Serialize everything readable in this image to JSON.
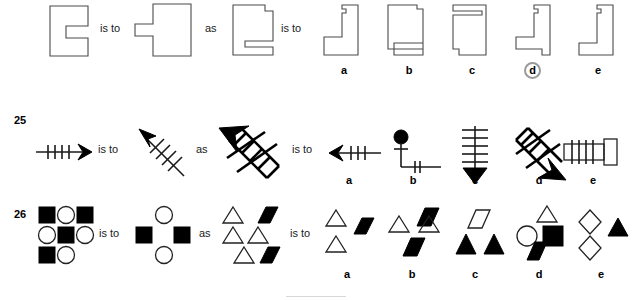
{
  "page": {
    "width": 635,
    "height": 300,
    "background": "#ffffff",
    "ink_color": "#1a1a1a",
    "outline_color": "#4a4a4a",
    "fill_color": "#000000"
  },
  "connectors": {
    "is_to": "is to",
    "as": "as"
  },
  "option_labels": [
    "a",
    "b",
    "c",
    "d",
    "e"
  ],
  "rows": [
    {
      "number": "",
      "name": "row-shapes-polygon",
      "type": "visual-analogy",
      "prompt_a": "notched-rectangle",
      "prompt_b": "rotated-notched-rectangle",
      "prompt_c": "tall-shape-with-step",
      "selected_option": "d",
      "options": [
        {
          "label": "a",
          "shape": "L-bracket-thin-with-top-notch",
          "selected": false
        },
        {
          "label": "b",
          "shape": "rectangle-with-bottom-slot",
          "selected": false
        },
        {
          "label": "c",
          "shape": "rectangle-with-top-slot-and-corner-cut",
          "selected": false
        },
        {
          "label": "d",
          "shape": "L-bracket-with-top-notch-and-foot",
          "selected": true
        },
        {
          "label": "e",
          "shape": "L-bracket-plain",
          "selected": false
        }
      ]
    },
    {
      "number": "25",
      "name": "row-arrows",
      "type": "visual-analogy",
      "prompt_a": "horizontal-right-arrow-with-4-ticks",
      "prompt_b": "diagonal-up-left-arrow-with-ticks",
      "prompt_c": "thick-diagonal-ladder-arrow-up-left",
      "selected_option": "",
      "options": [
        {
          "label": "a",
          "shape": "left-arrow-with-3-ticks",
          "selected": false
        },
        {
          "label": "b",
          "shape": "pin-with-bent-line-and-2-ticks",
          "selected": false
        },
        {
          "label": "c",
          "shape": "down-arrow-with-5-rungs",
          "selected": false
        },
        {
          "label": "d",
          "shape": "thick-diagonal-ladder-arrow-down-right",
          "selected": false
        },
        {
          "label": "e",
          "shape": "horizontal-bar-with-4-ticks-and-end-block",
          "selected": false
        }
      ]
    },
    {
      "number": "26",
      "name": "row-figures",
      "type": "visual-analogy",
      "prompt_a": "3x3-grid-of-filled-squares-and-circles",
      "prompt_b": "diamond-arrangement-circles-and-squares",
      "prompt_c": "triangles-and-filled-parallelograms",
      "selected_option": "",
      "options": [
        {
          "label": "a",
          "shape": "two-open-triangles-and-one-filled-parallelogram",
          "selected": false
        },
        {
          "label": "b",
          "shape": "two-open-triangles-and-two-filled-parallelograms",
          "selected": false
        },
        {
          "label": "c",
          "shape": "open-parallelogram-and-two-filled-triangles",
          "selected": false
        },
        {
          "label": "d",
          "shape": "open-triangle-circle-filled-square-filled-parallelogram",
          "selected": false
        },
        {
          "label": "e",
          "shape": "two-open-diamonds-and-filled-triangle",
          "selected": false
        }
      ]
    }
  ]
}
